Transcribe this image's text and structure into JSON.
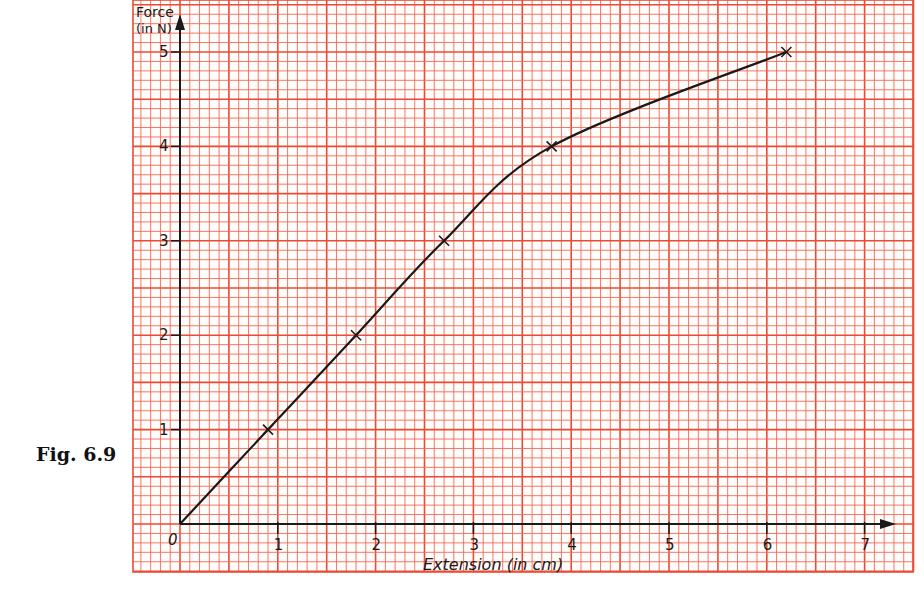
{
  "figure": {
    "caption": "Fig. 6.9"
  },
  "colors": {
    "grid_line": "#f26a55",
    "grid_major": "#ea4b36",
    "paper": "#fffdfb",
    "ink": "#1a1a1a"
  },
  "chart_data": {
    "type": "line",
    "title": "",
    "xlabel": "Extension (in cm)",
    "ylabel": "Force (in N)",
    "ylabel_line1": "Force",
    "ylabel_line2": "(in N)",
    "x_ticks": [
      "1",
      "2",
      "3",
      "4",
      "5",
      "6",
      "7"
    ],
    "y_ticks": [
      "1",
      "2",
      "3",
      "4",
      "5"
    ],
    "origin_label": "0",
    "xlim": [
      0,
      7.2
    ],
    "ylim": [
      0,
      5.3
    ],
    "grid": true,
    "legend": null,
    "series": [
      {
        "name": "Force vs Extension",
        "marker": "x",
        "x": [
          0,
          0.9,
          1.8,
          2.7,
          3.8,
          6.2
        ],
        "y": [
          0,
          1,
          2,
          3,
          4,
          5
        ]
      }
    ]
  }
}
